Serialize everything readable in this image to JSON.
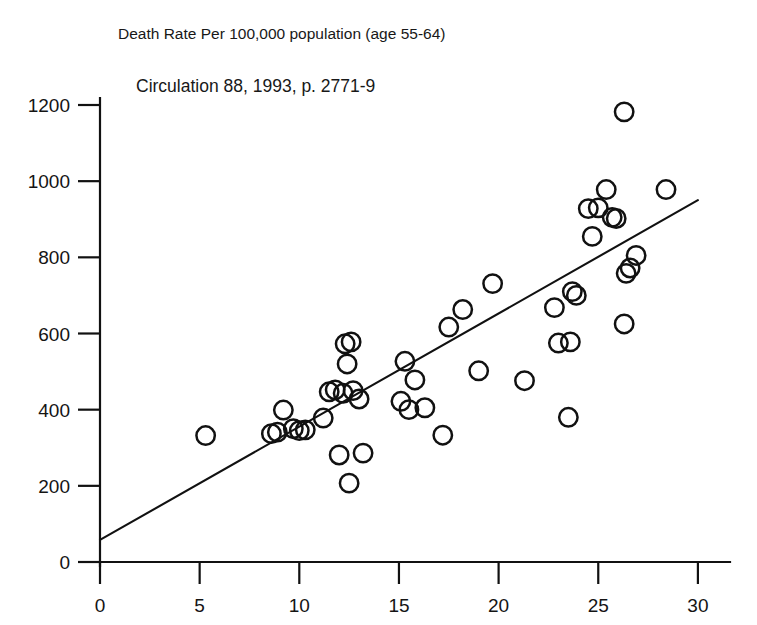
{
  "figure": {
    "title": "Death Rate Per 100,000  population (age 55-64)",
    "citation": "Circulation 88, 1993, p. 2771-9",
    "background_color": "#ffffff",
    "ink_color": "#111111"
  },
  "chart_data": {
    "type": "scatter",
    "title": "Death Rate Per 100,000  population (age 55-64)",
    "subtitle": "Circulation 88, 1993, p. 2771-9",
    "xlabel": "",
    "ylabel": "",
    "xlim": [
      0,
      31.5
    ],
    "ylim": [
      0,
      1270
    ],
    "grid": false,
    "legend": false,
    "marker": "open-circle",
    "xticks": [
      0,
      5,
      10,
      15,
      20,
      25,
      30
    ],
    "xtick_labels": [
      "0",
      "5",
      "10",
      "15",
      "20",
      "25",
      "30"
    ],
    "yticks": [
      0,
      200,
      400,
      600,
      800,
      1000,
      1200
    ],
    "ytick_labels": [
      "0",
      "200",
      "400",
      "600",
      "800",
      "1000",
      "1200"
    ],
    "points": [
      [
        5.3,
        332
      ],
      [
        8.6,
        337
      ],
      [
        8.9,
        341
      ],
      [
        9.2,
        399
      ],
      [
        9.7,
        350
      ],
      [
        10.0,
        345
      ],
      [
        10.3,
        347
      ],
      [
        11.2,
        378
      ],
      [
        11.5,
        447
      ],
      [
        11.8,
        452
      ],
      [
        12.0,
        281
      ],
      [
        12.2,
        443
      ],
      [
        12.3,
        573
      ],
      [
        12.4,
        520
      ],
      [
        12.5,
        207
      ],
      [
        12.6,
        578
      ],
      [
        12.7,
        450
      ],
      [
        13.0,
        428
      ],
      [
        13.2,
        286
      ],
      [
        15.1,
        422
      ],
      [
        15.3,
        527
      ],
      [
        15.5,
        400
      ],
      [
        15.8,
        478
      ],
      [
        16.3,
        405
      ],
      [
        17.2,
        333
      ],
      [
        17.5,
        617
      ],
      [
        18.2,
        663
      ],
      [
        19.0,
        502
      ],
      [
        19.7,
        731
      ],
      [
        21.3,
        476
      ],
      [
        22.8,
        668
      ],
      [
        23.0,
        575
      ],
      [
        23.5,
        380
      ],
      [
        23.6,
        578
      ],
      [
        23.7,
        710
      ],
      [
        23.9,
        700
      ],
      [
        24.5,
        928
      ],
      [
        24.7,
        855
      ],
      [
        25.0,
        930
      ],
      [
        25.4,
        978
      ],
      [
        25.7,
        905
      ],
      [
        25.9,
        902
      ],
      [
        26.3,
        1182
      ],
      [
        26.3,
        625
      ],
      [
        26.4,
        758
      ],
      [
        26.6,
        772
      ],
      [
        26.9,
        805
      ],
      [
        28.4,
        978
      ]
    ],
    "fit_line": {
      "label": "regression line",
      "x": [
        0,
        30
      ],
      "y": [
        58,
        950
      ]
    }
  }
}
